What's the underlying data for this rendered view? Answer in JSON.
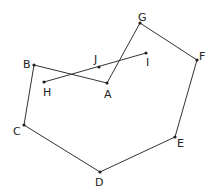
{
  "diagram": {
    "type": "labeled-point-graph",
    "colors": {
      "line": "#333333",
      "point": "#222222",
      "label": "#222222",
      "background": "#ffffff"
    },
    "points": [
      {
        "id": "A",
        "x": 107,
        "y": 83,
        "label": "A",
        "lx": 104,
        "ly": 98
      },
      {
        "id": "B",
        "x": 34,
        "y": 65,
        "label": "B",
        "lx": 23,
        "ly": 68
      },
      {
        "id": "C",
        "x": 24,
        "y": 125,
        "label": "C",
        "lx": 13,
        "ly": 135
      },
      {
        "id": "D",
        "x": 100,
        "y": 172,
        "label": "D",
        "lx": 95,
        "ly": 186
      },
      {
        "id": "E",
        "x": 175,
        "y": 137,
        "label": "E",
        "lx": 177,
        "ly": 147
      },
      {
        "id": "F",
        "x": 197,
        "y": 60,
        "label": "F",
        "lx": 199,
        "ly": 60
      },
      {
        "id": "G",
        "x": 140,
        "y": 23,
        "label": "G",
        "lx": 138,
        "ly": 21
      },
      {
        "id": "H",
        "x": 44,
        "y": 82,
        "label": "H",
        "lx": 43,
        "ly": 96
      },
      {
        "id": "I",
        "x": 146,
        "y": 53,
        "label": "I",
        "lx": 146,
        "ly": 66
      },
      {
        "id": "J",
        "x": 99,
        "y": 67,
        "label": "J",
        "lx": 94,
        "ly": 63
      }
    ],
    "edges": [
      [
        "A",
        "B"
      ],
      [
        "B",
        "C"
      ],
      [
        "C",
        "D"
      ],
      [
        "D",
        "E"
      ],
      [
        "E",
        "F"
      ],
      [
        "F",
        "G"
      ],
      [
        "G",
        "A"
      ],
      [
        "H",
        "I"
      ]
    ]
  }
}
